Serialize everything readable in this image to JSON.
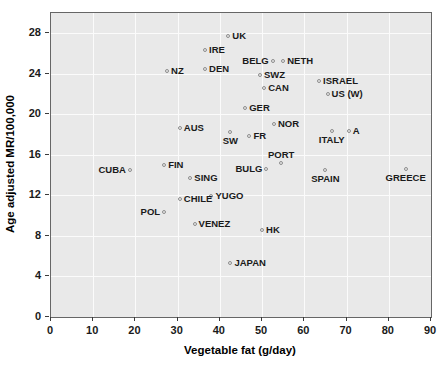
{
  "chart_data": {
    "type": "scatter",
    "title": "",
    "xlabel": "Vegetable fat (g/day)",
    "ylabel": "Age adjusted MR/100,000",
    "xlim": [
      0,
      90
    ],
    "ylim": [
      0,
      30
    ],
    "xticks": [
      0,
      10,
      20,
      30,
      40,
      50,
      60,
      70,
      80,
      90
    ],
    "yticks": [
      0,
      4,
      8,
      12,
      16,
      20,
      24,
      28
    ],
    "grid": true,
    "legend": "none",
    "marker_color": "#8d8d8d",
    "plot_background": "#e9e9e9",
    "gridline_color": "#fbfbfb",
    "points": [
      {
        "label": "UK",
        "x": 42.0,
        "y": 27.7,
        "lpos": "r"
      },
      {
        "label": "IRE",
        "x": 36.5,
        "y": 26.3,
        "lpos": "r"
      },
      {
        "label": "BELG",
        "x": 52.5,
        "y": 25.3,
        "lpos": "l"
      },
      {
        "label": "NETH",
        "x": 55.0,
        "y": 25.3,
        "lpos": "r"
      },
      {
        "label": "NZ",
        "x": 27.5,
        "y": 24.3,
        "lpos": "r"
      },
      {
        "label": "DEN",
        "x": 36.5,
        "y": 24.5,
        "lpos": "r"
      },
      {
        "label": "SWZ",
        "x": 49.5,
        "y": 23.9,
        "lpos": "r"
      },
      {
        "label": "ISRAEL",
        "x": 63.5,
        "y": 23.3,
        "lpos": "r"
      },
      {
        "label": "CAN",
        "x": 50.5,
        "y": 22.6,
        "lpos": "r"
      },
      {
        "label": "US (W)",
        "x": 65.5,
        "y": 22.0,
        "lpos": "r"
      },
      {
        "label": "GER",
        "x": 46.0,
        "y": 20.6,
        "lpos": "r"
      },
      {
        "label": "NOR",
        "x": 52.8,
        "y": 19.0,
        "lpos": "r"
      },
      {
        "label": "AUS",
        "x": 30.5,
        "y": 18.7,
        "lpos": "r"
      },
      {
        "label": "A",
        "x": 70.5,
        "y": 18.4,
        "lpos": "r"
      },
      {
        "label": "ITALY",
        "x": 66.5,
        "y": 18.4,
        "lpos": "b"
      },
      {
        "label": "FR",
        "x": 47.0,
        "y": 17.9,
        "lpos": "r"
      },
      {
        "label": "SW",
        "x": 42.5,
        "y": 18.3,
        "lpos": "b"
      },
      {
        "label": "PORT",
        "x": 54.5,
        "y": 15.2,
        "lpos": "t"
      },
      {
        "label": "FIN",
        "x": 26.8,
        "y": 15.0,
        "lpos": "r"
      },
      {
        "label": "CUBA",
        "x": 18.7,
        "y": 14.5,
        "lpos": "l"
      },
      {
        "label": "BULG",
        "x": 51.0,
        "y": 14.6,
        "lpos": "l"
      },
      {
        "label": "SPAIN",
        "x": 65.0,
        "y": 14.5,
        "lpos": "b"
      },
      {
        "label": "GREECE",
        "x": 84.0,
        "y": 14.6,
        "lpos": "b"
      },
      {
        "label": "SING",
        "x": 33.0,
        "y": 13.7,
        "lpos": "r"
      },
      {
        "label": "YUGO",
        "x": 38.0,
        "y": 11.9,
        "lpos": "r"
      },
      {
        "label": "CHILE",
        "x": 30.5,
        "y": 11.6,
        "lpos": "r"
      },
      {
        "label": "POL",
        "x": 26.8,
        "y": 10.4,
        "lpos": "l"
      },
      {
        "label": "VENEZ",
        "x": 34.0,
        "y": 9.2,
        "lpos": "r"
      },
      {
        "label": "HK",
        "x": 50.0,
        "y": 8.6,
        "lpos": "r"
      },
      {
        "label": "JAPAN",
        "x": 42.5,
        "y": 5.3,
        "lpos": "r"
      }
    ]
  }
}
